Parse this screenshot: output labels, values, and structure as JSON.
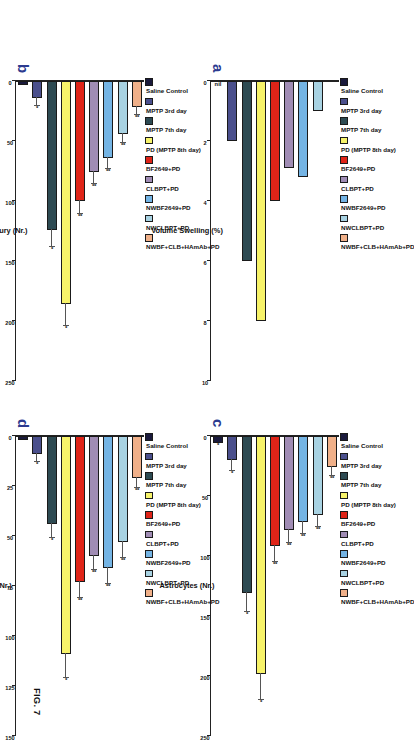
{
  "figure": {
    "caption": "FIG. 7",
    "groups": [
      {
        "label": "Saline Control",
        "color": "#1a1a3c"
      },
      {
        "label": "MPTP 3rd day",
        "color": "#4a4f8c"
      },
      {
        "label": "MPTP 7th day",
        "color": "#2d4a52"
      },
      {
        "label": "PD (MPTP 8th day)",
        "color": "#f7f36a"
      },
      {
        "label": "BF2649+PD",
        "color": "#df2418"
      },
      {
        "label": "CLBPT+PD",
        "color": "#a08cb4"
      },
      {
        "label": "NWBF2649+PD",
        "color": "#74b4e4"
      },
      {
        "label": "NWCLBPT+PD",
        "color": "#a8d2e2"
      },
      {
        "label": "NWBF+CLB+HAmAb+PD",
        "color": "#f0b089"
      }
    ]
  },
  "chart_data": [
    {
      "panel": "a",
      "type": "bar",
      "orientation": "horizontal",
      "title": "",
      "xlabel": "Volume Swelling (%)",
      "ylabel": "",
      "xlim": [
        0,
        10
      ],
      "xticks": [
        0,
        2,
        4,
        6,
        8,
        10
      ],
      "grid": false,
      "legend_position": "top",
      "categories": [
        "Saline Control",
        "MPTP 3rd day",
        "MPTP 7th day",
        "PD (MPTP 8th day)",
        "BF2649+PD",
        "CLBPT+PD",
        "NWBF2649+PD",
        "NWCLBPT+PD",
        "NWBF+CLB+HAmAb+PD"
      ],
      "values": [
        0,
        2.0,
        6.0,
        8.0,
        4.0,
        2.9,
        3.2,
        1.0,
        0
      ],
      "errors": [
        0,
        0,
        0,
        0,
        0,
        0,
        0,
        0,
        0
      ],
      "annotations": [
        "nil",
        "",
        "",
        "",
        "",
        "",
        "",
        "",
        ""
      ],
      "significance": [
        "",
        "",
        "",
        "",
        "",
        "",
        "",
        "",
        ""
      ]
    },
    {
      "panel": "b",
      "type": "bar",
      "orientation": "horizontal",
      "title": "",
      "xlabel": "Neuronal Injury (Nr.)",
      "ylabel": "",
      "xlim": [
        0,
        250
      ],
      "xticks": [
        0,
        50,
        100,
        150,
        200,
        250
      ],
      "grid": false,
      "legend_position": "top",
      "categories": [
        "Saline Control",
        "MPTP 3rd day",
        "MPTP 7th day",
        "PD (MPTP 8th day)",
        "BF2649+PD",
        "CLBPT+PD",
        "NWBF2649+PD",
        "NWCLBPT+PD",
        "NWBF+CLB+HAmAb+PD"
      ],
      "values": [
        3,
        14,
        124,
        186,
        100,
        76,
        64,
        44,
        22
      ],
      "errors": [
        0,
        7,
        14,
        18,
        11,
        10,
        9,
        8,
        6
      ],
      "annotations": [
        "",
        "",
        "",
        "",
        "",
        "",
        "",
        "",
        ""
      ],
      "significance": [
        "",
        "*",
        "*",
        "*",
        "**",
        "**",
        "**",
        "**",
        "**"
      ]
    },
    {
      "panel": "c",
      "type": "bar",
      "orientation": "horizontal",
      "title": "",
      "xlabel": "Astrocytes (Nr.)",
      "ylabel": "",
      "xlim": [
        0,
        250
      ],
      "xticks": [
        0,
        50,
        100,
        150,
        200,
        250
      ],
      "grid": false,
      "legend_position": "top",
      "categories": [
        "Saline Control",
        "MPTP 3rd day",
        "MPTP 7th day",
        "PD (MPTP 8th day)",
        "BF2649+PD",
        "CLBPT+PD",
        "NWBF2649+PD",
        "NWCLBPT+PD",
        "NWBF+CLB+HAmAb+PD"
      ],
      "values": [
        6,
        20,
        131,
        198,
        92,
        78,
        72,
        66,
        26
      ],
      "errors": [
        0,
        9,
        16,
        22,
        13,
        11,
        10,
        10,
        7
      ],
      "annotations": [
        "",
        "",
        "",
        "",
        "",
        "",
        "",
        "",
        ""
      ],
      "significance": [
        "*",
        "*",
        "*",
        "*",
        "**",
        "**",
        "**",
        "**",
        "**"
      ]
    },
    {
      "panel": "d",
      "type": "bar",
      "orientation": "horizontal",
      "title": "",
      "xlabel": "Axons (Nr.)",
      "ylabel": "",
      "xlim": [
        0,
        150
      ],
      "xticks": [
        0,
        25,
        50,
        75,
        100,
        125,
        150
      ],
      "grid": false,
      "legend_position": "top",
      "categories": [
        "Saline Control",
        "MPTP 3rd day",
        "MPTP 7th day",
        "PD (MPTP 8th day)",
        "BF2649+PD",
        "CLBPT+PD",
        "NWBF2649+PD",
        "NWCLBPT+PD",
        "NWBF+CLB+HAmAb+PD"
      ],
      "values": [
        2,
        9,
        44,
        109,
        73,
        60,
        66,
        53,
        21
      ],
      "errors": [
        0,
        4,
        7,
        12,
        8,
        7,
        8,
        8,
        5
      ],
      "annotations": [
        "",
        "",
        "",
        "",
        "",
        "",
        "",
        "",
        ""
      ],
      "significance": [
        "",
        "*",
        "*",
        "*",
        "**",
        "**",
        "**",
        "**",
        "**"
      ]
    }
  ]
}
